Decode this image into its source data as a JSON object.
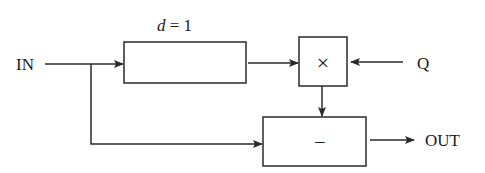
{
  "diagram": {
    "type": "block-diagram",
    "labels": {
      "input": "IN",
      "output": "OUT",
      "q_input": "Q",
      "delay_param_var": "d",
      "delay_param_rest": " = 1"
    },
    "blocks": [
      {
        "id": "delay",
        "symbol": "",
        "label": "d = 1"
      },
      {
        "id": "multiply",
        "symbol": "×"
      },
      {
        "id": "subtract",
        "symbol": "−"
      }
    ],
    "connections": [
      {
        "from": "IN",
        "to": "delay"
      },
      {
        "from": "delay",
        "to": "multiply"
      },
      {
        "from": "Q",
        "to": "multiply"
      },
      {
        "from": "multiply",
        "to": "subtract"
      },
      {
        "from": "IN",
        "to": "subtract"
      },
      {
        "from": "subtract",
        "to": "OUT"
      }
    ],
    "colors": {
      "stroke": "#2a2a2a",
      "background": "#ffffff"
    }
  }
}
